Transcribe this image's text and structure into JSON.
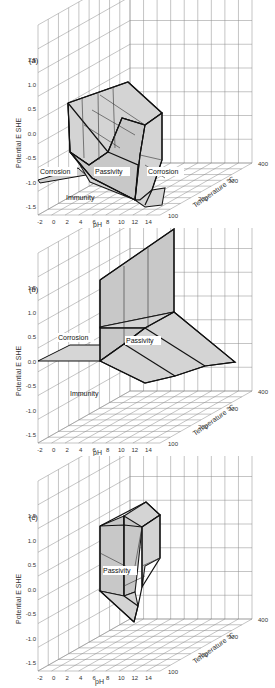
{
  "chart_data": [
    {
      "type": "3d-surface-diagram",
      "panel_label": "(a)",
      "title": "",
      "xlabel": "pH",
      "ylabel": "Potential  E  SHE",
      "zlabel": "Temperature °C",
      "x_ticks": [
        "-2",
        "0",
        "2",
        "4",
        "6",
        "8",
        "10",
        "12",
        "14"
      ],
      "y_ticks": [
        "1.5",
        "1.0",
        "0.5",
        "0.0",
        "-0.5",
        "-1.0",
        "-1.5"
      ],
      "z_ticks": [
        "100",
        "200",
        "300",
        "400"
      ],
      "xlim": [
        -2,
        16
      ],
      "ylim": [
        -2.0,
        2.0
      ],
      "zlim": [
        100,
        400
      ],
      "grid": true,
      "regions": [
        "Corrosion",
        "Passivity",
        "Corrosion",
        "Immunity"
      ]
    },
    {
      "type": "3d-surface-diagram",
      "panel_label": "(b)",
      "xlabel": "pH",
      "ylabel": "Potential  E  SHE",
      "zlabel": "Temperature °C",
      "x_ticks": [
        "-2",
        "0",
        "2",
        "4",
        "6",
        "8",
        "10",
        "12",
        "14"
      ],
      "y_ticks": [
        "1.5",
        "1.0",
        "0.5",
        "0.0",
        "-0.5",
        "-1.0",
        "-1.5"
      ],
      "z_ticks": [
        "100",
        "200",
        "300",
        "400"
      ],
      "xlim": [
        -2,
        16
      ],
      "ylim": [
        -2.0,
        2.0
      ],
      "zlim": [
        100,
        400
      ],
      "grid": true,
      "regions": [
        "Corrosion",
        "Passivity",
        "Immunity"
      ]
    },
    {
      "type": "3d-surface-diagram",
      "panel_label": "(c)",
      "xlabel": "pH",
      "ylabel": "Potential  E  SHE",
      "zlabel": "Temperature °C",
      "x_ticks": [
        "-2",
        "0",
        "2",
        "4",
        "6",
        "8",
        "10",
        "12",
        "14"
      ],
      "y_ticks": [
        "1.5",
        "1.0",
        "0.5",
        "0.0",
        "-0.5",
        "-1.0",
        "-1.5"
      ],
      "z_ticks": [
        "100",
        "200",
        "300",
        "400"
      ],
      "xlim": [
        -2,
        16
      ],
      "ylim": [
        -2.0,
        2.0
      ],
      "zlim": [
        100,
        400
      ],
      "grid": true,
      "regions": [
        "Passivity"
      ]
    }
  ],
  "panels": {
    "a": {
      "label": "(a)",
      "ylabel": "Potential  E  SHE",
      "xlabel": "pH",
      "zlabel": "Temperature °C",
      "yticks": [
        "1.5",
        "1.0",
        "0.5",
        "0.0",
        "-0.5",
        "-1.0",
        "-1.5"
      ],
      "xticks": [
        "-2",
        "0",
        "2",
        "4",
        "6",
        "8",
        "10",
        "12",
        "14"
      ],
      "zticks": [
        "100",
        "200",
        "300",
        "400"
      ],
      "regions": {
        "corrosion_left": "Corrosion",
        "passivity": "Passivity",
        "corrosion_right": "Corrosion",
        "immunity": "Immunity"
      }
    },
    "b": {
      "label": "(b)",
      "ylabel": "Potential  E  SHE",
      "xlabel": "pH",
      "zlabel": "Temperature °C",
      "yticks": [
        "1.5",
        "1.0",
        "0.5",
        "0.0",
        "-0.5",
        "-1.0",
        "-1.5"
      ],
      "xticks": [
        "-2",
        "0",
        "2",
        "4",
        "6",
        "8",
        "10",
        "12",
        "14"
      ],
      "zticks": [
        "100",
        "200",
        "300",
        "400"
      ],
      "regions": {
        "corrosion": "Corrosion",
        "passivity": "Passivity",
        "immunity": "Immunity"
      }
    },
    "c": {
      "label": "(c)",
      "ylabel": "Potential  E  SHE",
      "xlabel": "pH",
      "zlabel": "Temperature °C",
      "yticks": [
        "1.5",
        "1.0",
        "0.5",
        "0.0",
        "-0.5",
        "-1.0",
        "-1.5"
      ],
      "xticks": [
        "-2",
        "0",
        "2",
        "4",
        "6",
        "8",
        "10",
        "12",
        "14"
      ],
      "zticks": [
        "100",
        "200",
        "300",
        "400"
      ],
      "regions": {
        "passivity": "Passivity"
      }
    }
  }
}
